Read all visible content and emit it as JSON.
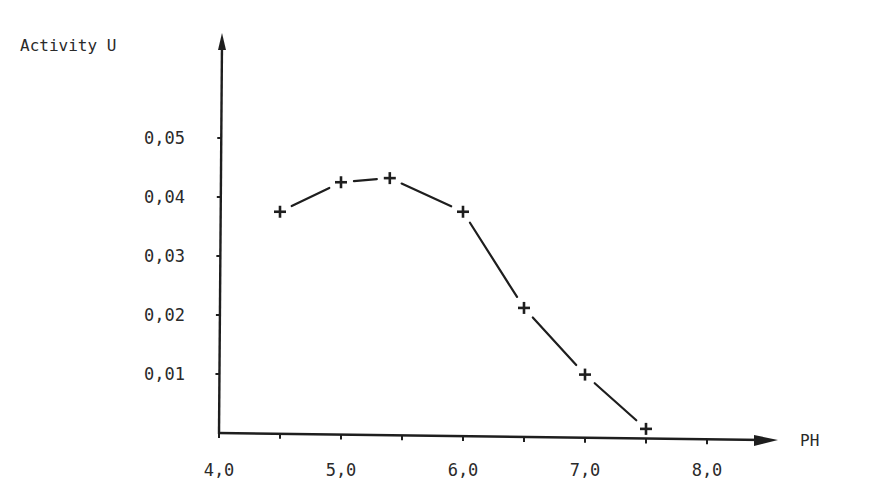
{
  "chart_data": {
    "type": "line",
    "title": "",
    "xlabel": "PH",
    "ylabel": "Activity U",
    "x": [
      4.5,
      5.0,
      5.4,
      6.0,
      6.5,
      7.0,
      7.5
    ],
    "series": [
      {
        "name": "Activity",
        "marker": "+",
        "values": [
          0.0375,
          0.0425,
          0.0432,
          0.0375,
          0.0212,
          0.0099,
          0.0007
        ]
      }
    ],
    "xlim": [
      4.0,
      8.5
    ],
    "ylim": [
      0.0,
      0.066
    ],
    "x_ticks": [
      4.0,
      4.5,
      5.0,
      5.5,
      6.0,
      6.5,
      7.0,
      7.5,
      8.0
    ],
    "x_tick_labels": [
      "4,0",
      "5,0",
      "6,0",
      "7,0",
      "8,0"
    ],
    "y_ticks": [
      0.01,
      0.02,
      0.03,
      0.04,
      0.05
    ],
    "y_tick_labels": [
      "0,01",
      "0,02",
      "0,03",
      "0,04",
      "0,05"
    ],
    "grid": false,
    "legend": "none"
  },
  "axes": {
    "y_title": "Activity U",
    "x_title": "PH"
  },
  "colors": {
    "ink": "#1e1e1e",
    "text": "#2a2a2a",
    "background": "#ffffff"
  }
}
